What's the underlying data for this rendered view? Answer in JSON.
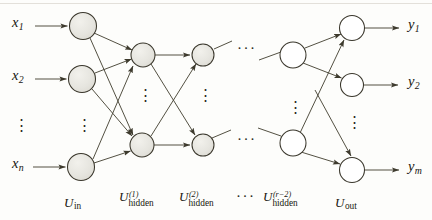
{
  "figure": {
    "type": "diagram",
    "width": 432,
    "height": 220
  },
  "colors": {
    "page_background": "#fdfdfb",
    "ink": "#1a1810",
    "node_stroke": "#3a372c",
    "node_fill_shaded": "#e4e3dd",
    "node_fill_plain": "#ffffff",
    "edge": "#4a4738"
  },
  "inputs": {
    "label_prefix": "x",
    "items": [
      {
        "name": "x",
        "sub": "1"
      },
      {
        "name": "x",
        "sub": "2"
      },
      {
        "name": "x",
        "sub": "n"
      }
    ],
    "ellipsis": "⋮"
  },
  "outputs": {
    "label_prefix": "y",
    "items": [
      {
        "name": "y",
        "sub": "1"
      },
      {
        "name": "y",
        "sub": "2"
      },
      {
        "name": "y",
        "sub": "m"
      }
    ],
    "ellipsis": "⋮"
  },
  "layers": [
    {
      "id": "u-in",
      "base": "U",
      "subscript": "in",
      "superscript": "",
      "node_count_visible": 3,
      "node_fill": "shaded",
      "x": 82,
      "label_x": 64,
      "label_y": 196
    },
    {
      "id": "u-hidden-1",
      "base": "U",
      "subscript": "hidden",
      "superscript": "(1)",
      "node_count_visible": 2,
      "node_fill": "shaded",
      "x": 143,
      "label_x": 119,
      "label_y": 192
    },
    {
      "id": "u-hidden-2",
      "base": "U",
      "subscript": "hidden",
      "superscript": "(2)",
      "node_count_visible": 2,
      "node_fill": "shaded",
      "x": 203,
      "label_x": 179,
      "label_y": 192
    },
    {
      "id": "u-hidden-r-2",
      "base": "U",
      "subscript": "hidden",
      "superscript": "(r−2)",
      "node_count_visible": 2,
      "node_fill": "plain",
      "x": 293,
      "label_x": 263,
      "label_y": 192
    },
    {
      "id": "u-out",
      "base": "U",
      "subscript": "out",
      "superscript": "",
      "node_count_visible": 3,
      "node_fill": "plain",
      "x": 352,
      "label_x": 335,
      "label_y": 196
    }
  ],
  "layer_gap_ellipsis": {
    "glyph": "···",
    "positions": [
      {
        "x": 239,
        "y": 48
      },
      {
        "x": 239,
        "y": 139
      },
      {
        "x": 239,
        "y": 190
      }
    ]
  },
  "intra_layer_ellipsis": {
    "glyph": "⋮",
    "positions": [
      {
        "x": 78,
        "y": 120
      },
      {
        "x": 139,
        "y": 92
      },
      {
        "x": 199,
        "y": 92
      },
      {
        "x": 289,
        "y": 104
      },
      {
        "x": 348,
        "y": 118
      }
    ]
  },
  "nodes": {
    "input": [
      {
        "cx": 83,
        "cy": 26,
        "r": 13.5
      },
      {
        "cx": 82,
        "cy": 79,
        "r": 13.5
      },
      {
        "cx": 81,
        "cy": 167,
        "r": 13.5
      }
    ],
    "hidden1": [
      {
        "cx": 143,
        "cy": 55,
        "r": 12
      },
      {
        "cx": 142,
        "cy": 145,
        "r": 12
      }
    ],
    "hidden2": [
      {
        "cx": 203,
        "cy": 55,
        "r": 11
      },
      {
        "cx": 203,
        "cy": 145,
        "r": 11
      }
    ],
    "hiddenR2": [
      {
        "cx": 293,
        "cy": 55,
        "r": 13
      },
      {
        "cx": 293,
        "cy": 143,
        "r": 13
      }
    ],
    "output": [
      {
        "cx": 352,
        "cy": 28,
        "r": 12.5
      },
      {
        "cx": 352,
        "cy": 85,
        "r": 11.5
      },
      {
        "cx": 352,
        "cy": 170,
        "r": 12.5
      }
    ]
  },
  "arrows": {
    "input_stubs": [
      {
        "x1": 35,
        "y1": 26,
        "x2": 67,
        "y2": 26
      },
      {
        "x1": 35,
        "y1": 79,
        "x2": 66,
        "y2": 79
      },
      {
        "x1": 33,
        "y1": 167,
        "x2": 65,
        "y2": 167
      }
    ],
    "output_stubs": [
      {
        "x1": 366,
        "y1": 28,
        "x2": 400,
        "y2": 28
      },
      {
        "x1": 365,
        "y1": 85,
        "x2": 399,
        "y2": 85
      },
      {
        "x1": 366,
        "y1": 170,
        "x2": 400,
        "y2": 170
      }
    ],
    "connections_count": 16
  },
  "text_labels": {
    "x1": "x",
    "x1_sub": "1",
    "x2": "x",
    "x2_sub": "2",
    "xn": "x",
    "xn_sub": "n",
    "y1": "y",
    "y1_sub": "1",
    "y2": "y",
    "y2_sub": "2",
    "ym": "y",
    "ym_sub": "m",
    "u_base": "U",
    "sub_in": "in",
    "sub_hidden": "hidden",
    "sub_out": "out",
    "sup_1": "(1)",
    "sup_2": "(2)",
    "sup_r2": "(r−2)"
  }
}
